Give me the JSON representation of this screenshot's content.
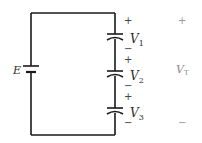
{
  "diagram": {
    "type": "series-capacitor-circuit",
    "source": {
      "label": "E",
      "symbol": "battery-icon"
    },
    "capacitors": [
      {
        "label": "V",
        "subscript": "1",
        "plus": "+",
        "minus": "−"
      },
      {
        "label": "V",
        "subscript": "2",
        "plus": "+",
        "minus": "−"
      },
      {
        "label": "V",
        "subscript": "3",
        "plus": "+",
        "minus": "−"
      }
    ],
    "total": {
      "label": "V",
      "subscript": "T",
      "plus": "+",
      "minus": "−"
    },
    "colors": {
      "wire": "#1a1a1a",
      "label": "#2a2a2a",
      "faint_label": "#8a8a8a"
    }
  }
}
